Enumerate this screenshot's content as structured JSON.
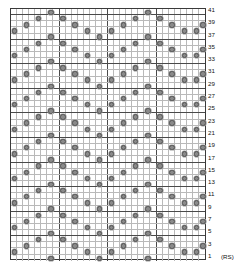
{
  "chart": {
    "type": "knitting-chart-grid",
    "columns": 32,
    "rows": 41,
    "symbol_name": "purl-dot-symbol",
    "grid_line_color": "#b9b9b9",
    "major_line_color": "#4a4a4a",
    "border_color": "#3a3a3a",
    "symbol_color": "#8a8a8a",
    "major_column_every": 8,
    "major_row_every": 4,
    "rs_label": "(RS)",
    "row_numbers": [
      41,
      39,
      37,
      35,
      33,
      31,
      29,
      27,
      25,
      23,
      21,
      19,
      17,
      15,
      13,
      11,
      9,
      7,
      5,
      3,
      1
    ],
    "row_number_order": "top-to-bottom-descending-odd",
    "symbols": [
      {
        "row": 41,
        "cols": [
          6,
          22
        ]
      },
      {
        "row": 40,
        "cols": [
          4,
          8,
          20,
          24
        ]
      },
      {
        "row": 39,
        "cols": [
          2,
          10,
          18,
          26,
          31
        ]
      },
      {
        "row": 38,
        "cols": [
          0,
          12,
          16,
          28,
          30
        ]
      },
      {
        "row": 37,
        "cols": [
          6,
          14,
          22
        ]
      },
      {
        "row": 36,
        "cols": [
          4,
          8,
          20,
          24
        ]
      },
      {
        "row": 35,
        "cols": [
          2,
          10,
          18,
          26,
          31
        ]
      },
      {
        "row": 34,
        "cols": [
          0,
          12,
          16,
          28,
          30
        ]
      },
      {
        "row": 33,
        "cols": [
          6,
          14,
          22
        ]
      },
      {
        "row": 32,
        "cols": [
          4,
          8,
          20,
          24
        ]
      },
      {
        "row": 31,
        "cols": [
          2,
          10,
          18,
          26,
          31
        ]
      },
      {
        "row": 30,
        "cols": [
          0,
          12,
          16,
          28,
          30
        ]
      },
      {
        "row": 29,
        "cols": [
          6,
          14,
          22
        ]
      },
      {
        "row": 28,
        "cols": [
          4,
          8,
          20,
          24
        ]
      },
      {
        "row": 27,
        "cols": [
          2,
          10,
          18,
          26,
          31
        ]
      },
      {
        "row": 26,
        "cols": [
          0,
          12,
          16,
          28,
          30
        ]
      },
      {
        "row": 25,
        "cols": [
          6,
          14,
          22
        ]
      },
      {
        "row": 24,
        "cols": [
          4,
          8,
          20,
          24
        ]
      },
      {
        "row": 23,
        "cols": [
          2,
          10,
          18,
          26,
          31
        ]
      },
      {
        "row": 22,
        "cols": [
          0,
          12,
          16,
          28,
          30
        ]
      },
      {
        "row": 21,
        "cols": [
          6,
          14,
          22
        ]
      },
      {
        "row": 20,
        "cols": [
          4,
          8,
          20,
          24
        ]
      },
      {
        "row": 19,
        "cols": [
          2,
          10,
          18,
          26,
          31
        ]
      },
      {
        "row": 18,
        "cols": [
          0,
          12,
          16,
          28,
          30
        ]
      },
      {
        "row": 17,
        "cols": [
          6,
          14,
          22
        ]
      },
      {
        "row": 16,
        "cols": [
          4,
          8,
          20,
          24
        ]
      },
      {
        "row": 15,
        "cols": [
          2,
          10,
          18,
          26,
          31
        ]
      },
      {
        "row": 14,
        "cols": [
          0,
          12,
          16,
          28,
          30
        ]
      },
      {
        "row": 13,
        "cols": [
          6,
          14,
          22
        ]
      },
      {
        "row": 12,
        "cols": [
          4,
          8,
          20,
          24
        ]
      },
      {
        "row": 11,
        "cols": [
          2,
          10,
          18,
          26,
          31
        ]
      },
      {
        "row": 10,
        "cols": [
          0,
          12,
          16,
          28,
          30
        ]
      },
      {
        "row": 9,
        "cols": [
          6,
          14,
          22
        ]
      },
      {
        "row": 8,
        "cols": [
          4,
          8,
          20,
          24
        ]
      },
      {
        "row": 7,
        "cols": [
          2,
          10,
          18,
          26,
          31
        ]
      },
      {
        "row": 6,
        "cols": [
          0,
          12,
          16,
          28,
          30
        ]
      },
      {
        "row": 5,
        "cols": [
          6,
          14,
          22
        ]
      },
      {
        "row": 4,
        "cols": [
          4,
          8,
          20,
          24
        ]
      },
      {
        "row": 3,
        "cols": [
          2,
          10,
          18,
          26,
          31
        ]
      },
      {
        "row": 2,
        "cols": [
          0,
          12,
          16,
          28,
          30
        ]
      },
      {
        "row": 1,
        "cols": [
          6,
          14,
          22
        ]
      }
    ]
  },
  "chart_data": {
    "type": "heatmap",
    "xlabel": "",
    "ylabel": "",
    "grid": "on",
    "legend": "none",
    "x": [
      "1",
      "2",
      "3",
      "4",
      "5",
      "6",
      "7",
      "8",
      "9",
      "10",
      "11",
      "12",
      "13",
      "14",
      "15",
      "16",
      "17",
      "18",
      "19",
      "20",
      "21",
      "22",
      "23",
      "24",
      "25",
      "26",
      "27",
      "28",
      "29",
      "30",
      "31",
      "32"
    ],
    "y": [
      "1",
      "2",
      "3",
      "4",
      "5",
      "6",
      "7",
      "8",
      "9",
      "10",
      "11",
      "12",
      "13",
      "14",
      "15",
      "16",
      "17",
      "18",
      "19",
      "20",
      "21",
      "22",
      "23",
      "24",
      "25",
      "26",
      "27",
      "28",
      "29",
      "30",
      "31",
      "32",
      "33",
      "34",
      "35",
      "36",
      "37",
      "38",
      "39",
      "40",
      "41"
    ],
    "tick_labels_right": [
      "41",
      "39",
      "37",
      "35",
      "33",
      "31",
      "29",
      "27",
      "25",
      "23",
      "21",
      "19",
      "17",
      "15",
      "13",
      "11",
      "9",
      "7",
      "5",
      "3",
      "1"
    ],
    "annotations": [
      "1 (RS)"
    ],
    "values_note": "1 = purl dot symbol, 0 = blank knit cell; pattern is a 16-stitch x 8-row travelling lattice repeat"
  }
}
